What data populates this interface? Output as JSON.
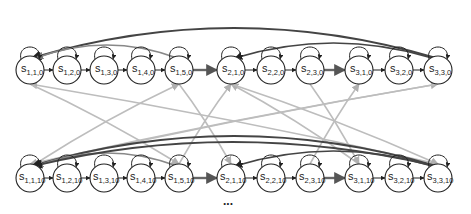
{
  "diagram": {
    "type": "state-transition-graph",
    "colors": {
      "node_stroke": "#222222",
      "forward_edge": "#222222",
      "thick_forward_edge": "#555555",
      "return_edge_dark": "#444444",
      "return_edge_mid": "#777777",
      "cross_edge_light": "#b8b8b8"
    },
    "rows": [
      {
        "y": 70,
        "nodes": [
          {
            "id": "s110",
            "base": "s",
            "sub": "1,1,0",
            "x": 30
          },
          {
            "id": "s120",
            "base": "s",
            "sub": "1,2,0",
            "x": 67
          },
          {
            "id": "s130",
            "base": "s",
            "sub": "1,3,0",
            "x": 104
          },
          {
            "id": "s140",
            "base": "s",
            "sub": "1,4,0",
            "x": 141
          },
          {
            "id": "s150",
            "base": "s",
            "sub": "1,5,0",
            "x": 179
          },
          {
            "id": "s210",
            "base": "s",
            "sub": "2,1,0",
            "x": 231
          },
          {
            "id": "s220",
            "base": "s",
            "sub": "2,2,0",
            "x": 271
          },
          {
            "id": "s230",
            "base": "s",
            "sub": "2,3,0",
            "x": 310
          },
          {
            "id": "s310",
            "base": "s",
            "sub": "3,1,0",
            "x": 359
          },
          {
            "id": "s320",
            "base": "s",
            "sub": "3,2,0",
            "x": 399
          },
          {
            "id": "s330",
            "base": "s",
            "sub": "3,3,0",
            "x": 438
          }
        ]
      },
      {
        "y": 178,
        "nodes": [
          {
            "id": "s1110",
            "base": "s",
            "sub": "1,1,10",
            "x": 30
          },
          {
            "id": "s1210",
            "base": "s",
            "sub": "1,2,10",
            "x": 67
          },
          {
            "id": "s1310",
            "base": "s",
            "sub": "1,3,10",
            "x": 104
          },
          {
            "id": "s1410",
            "base": "s",
            "sub": "1,4,10",
            "x": 141
          },
          {
            "id": "s1510",
            "base": "s",
            "sub": "1,5,10",
            "x": 179
          },
          {
            "id": "s2110",
            "base": "s",
            "sub": "2,1,10",
            "x": 231
          },
          {
            "id": "s2210",
            "base": "s",
            "sub": "2,2,10",
            "x": 271
          },
          {
            "id": "s2310",
            "base": "s",
            "sub": "2,3,10",
            "x": 310
          },
          {
            "id": "s3110",
            "base": "s",
            "sub": "3,1,10",
            "x": 359
          },
          {
            "id": "s3210",
            "base": "s",
            "sub": "3,2,10",
            "x": 399
          },
          {
            "id": "s3310",
            "base": "s",
            "sub": "3,3,10",
            "x": 438
          }
        ]
      }
    ],
    "node_radius": 14,
    "ellipsis": "..."
  }
}
